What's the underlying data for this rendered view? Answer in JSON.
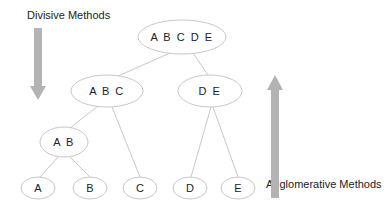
{
  "diagram": {
    "captions": {
      "divisive": "Divisive Methods",
      "agglomerative": "Agglomerative Methods"
    },
    "colors": {
      "node_stroke": "#c8c8c8",
      "edge": "#c8c8c8",
      "arrow": "#b3b3b3",
      "text": "#222222"
    },
    "nodes": {
      "root": "A B C D E",
      "abc": "A B C",
      "de": "D E",
      "ab": "A B",
      "a": "A",
      "b": "B",
      "c": "C",
      "d": "D",
      "e": "E"
    },
    "edges": [
      [
        "A B C D E",
        "A B C"
      ],
      [
        "A B C D E",
        "D E"
      ],
      [
        "A B C",
        "A B"
      ],
      [
        "A B C",
        "C"
      ],
      [
        "A B",
        "A"
      ],
      [
        "A B",
        "B"
      ],
      [
        "D E",
        "D"
      ],
      [
        "D E",
        "E"
      ]
    ],
    "arrows": {
      "divisive_direction": "down",
      "agglomerative_direction": "up"
    }
  }
}
